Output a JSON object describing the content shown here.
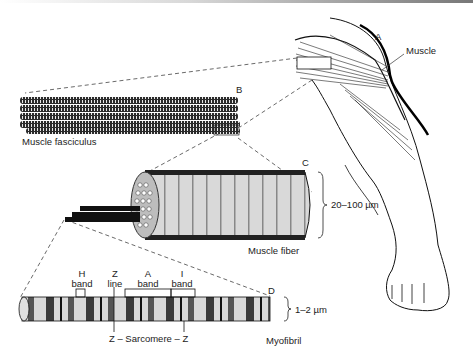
{
  "figure": {
    "panels": [
      {
        "letter": "A",
        "label": "Muscle"
      },
      {
        "letter": "B",
        "label": "Muscle fasciculus"
      },
      {
        "letter": "C",
        "label": "Muscle fiber",
        "size": "20–100 µm"
      },
      {
        "letter": "D",
        "label": "Myofibril",
        "size": "1–2 µm"
      }
    ],
    "myofibril_labels": {
      "h_band": {
        "line1": "H",
        "line2": "band"
      },
      "z_line": {
        "line1": "Z",
        "line2": "line"
      },
      "a_band": {
        "line1": "A",
        "line2": "band"
      },
      "i_band": {
        "line1": "I",
        "line2": "band"
      },
      "sarcomere": "Z – Sarcomere – Z"
    }
  }
}
